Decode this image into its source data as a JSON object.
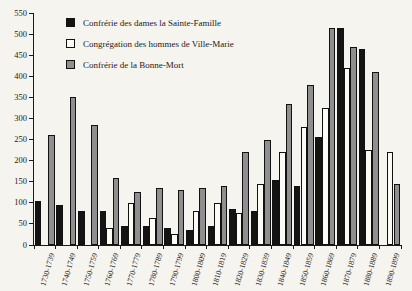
{
  "chart_data": {
    "type": "bar",
    "title": "",
    "xlabel": "",
    "ylabel": "",
    "ylim": [
      0,
      550
    ],
    "ytick_step": 50,
    "grid": false,
    "legend_position": "top-left",
    "categories": [
      "1730-1739",
      "1740-1749",
      "1750-1759",
      "1760-1769",
      "1770-1779",
      "1780-1789",
      "1790-1799",
      "1800-1809",
      "1810-1819",
      "1820-1829",
      "1830-1839",
      "1840-1849",
      "1850-1859",
      "1860-1869",
      "1870-1879",
      "1880-1889",
      "1890-1899"
    ],
    "series": [
      {
        "id": "confrerie-dames-sainte-famille",
        "name": "Confrérie des dames la Sainte-Famille",
        "color": "#141414",
        "values": [
          105,
          95,
          80,
          80,
          45,
          45,
          40,
          35,
          45,
          85,
          80,
          155,
          140,
          255,
          515,
          465,
          0
        ]
      },
      {
        "id": "congregation-hommes-ville-marie",
        "name": "Congrégation des hommes de Ville-Marie",
        "color": "#fcfbf6",
        "values": [
          0,
          0,
          0,
          40,
          100,
          65,
          25,
          80,
          100,
          75,
          145,
          220,
          280,
          325,
          420,
          225,
          220
        ]
      },
      {
        "id": "confrerie-bonne-mort",
        "name": "Confrérie de la Bonne-Mort",
        "color": "#8f8f8f",
        "values": [
          260,
          350,
          285,
          160,
          125,
          135,
          130,
          135,
          140,
          220,
          250,
          335,
          380,
          515,
          470,
          410,
          145
        ]
      }
    ]
  }
}
